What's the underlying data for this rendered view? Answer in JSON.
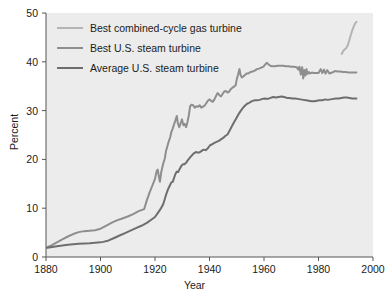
{
  "chart_data": {
    "type": "line",
    "title": "",
    "xlabel": "Year",
    "ylabel": "Percent",
    "xlim": [
      1880,
      2000
    ],
    "ylim": [
      0,
      50
    ],
    "xticks": [
      1880,
      1900,
      1920,
      1940,
      1960,
      1980,
      2000
    ],
    "yticks": [
      0,
      10,
      20,
      30,
      40,
      50
    ],
    "grid": false,
    "legend_position": "top-left",
    "series": [
      {
        "name": "Best combined-cycle gas turbine",
        "color": "#b4b4b4",
        "points": [
          [
            1988.5,
            41.6
          ],
          [
            1989.2,
            42.3
          ],
          [
            1989.8,
            42.6
          ],
          [
            1990.3,
            42.9
          ],
          [
            1990.8,
            43.5
          ],
          [
            1991.3,
            44.4
          ],
          [
            1991.8,
            45.4
          ],
          [
            1992.3,
            46.3
          ],
          [
            1992.9,
            47.2
          ],
          [
            1993.4,
            47.8
          ],
          [
            1993.9,
            48.2
          ]
        ]
      },
      {
        "name": "Best U.S. steam turbine",
        "color": "#8e8e8e",
        "points": [
          [
            1880.5,
            2.0
          ],
          [
            1882,
            2.4
          ],
          [
            1884,
            3.0
          ],
          [
            1886,
            3.6
          ],
          [
            1888,
            4.2
          ],
          [
            1890,
            4.7
          ],
          [
            1892,
            5.1
          ],
          [
            1894,
            5.3
          ],
          [
            1896,
            5.4
          ],
          [
            1898,
            5.5
          ],
          [
            1900,
            5.8
          ],
          [
            1902,
            6.4
          ],
          [
            1904,
            7.0
          ],
          [
            1906,
            7.5
          ],
          [
            1908,
            7.9
          ],
          [
            1910,
            8.3
          ],
          [
            1912,
            8.8
          ],
          [
            1914,
            9.4
          ],
          [
            1916,
            9.8
          ],
          [
            1917,
            11.6
          ],
          [
            1918,
            13.2
          ],
          [
            1919,
            14.6
          ],
          [
            1920,
            16.0
          ],
          [
            1920.6,
            17.6
          ],
          [
            1921,
            17.9
          ],
          [
            1921.4,
            16.6
          ],
          [
            1921.8,
            15.4
          ],
          [
            1922.3,
            17.4
          ],
          [
            1923,
            19.1
          ],
          [
            1923.6,
            20.2
          ],
          [
            1924,
            21.6
          ],
          [
            1924.6,
            22.8
          ],
          [
            1925,
            23.6
          ],
          [
            1925.6,
            24.6
          ],
          [
            1926,
            25.6
          ],
          [
            1926.5,
            26.3
          ],
          [
            1927,
            27.2
          ],
          [
            1927.5,
            28.0
          ],
          [
            1928,
            28.9
          ],
          [
            1928.4,
            27.4
          ],
          [
            1928.9,
            26.6
          ],
          [
            1929.4,
            27.4
          ],
          [
            1929.9,
            28.2
          ],
          [
            1930.4,
            27.0
          ],
          [
            1930.9,
            27.3
          ],
          [
            1931.4,
            26.6
          ],
          [
            1931.9,
            27.6
          ],
          [
            1932.4,
            29.0
          ],
          [
            1932.9,
            30.9
          ],
          [
            1933.4,
            31.2
          ],
          [
            1934,
            31.1
          ],
          [
            1934.6,
            30.6
          ],
          [
            1935.2,
            30.9
          ],
          [
            1935.8,
            30.8
          ],
          [
            1936.4,
            31.1
          ],
          [
            1937,
            30.6
          ],
          [
            1937.6,
            30.8
          ],
          [
            1938.2,
            31.0
          ],
          [
            1938.8,
            31.5
          ],
          [
            1939.4,
            32.0
          ],
          [
            1940,
            32.3
          ],
          [
            1940.6,
            32.0
          ],
          [
            1941.2,
            31.8
          ],
          [
            1941.8,
            32.3
          ],
          [
            1942.4,
            33.0
          ],
          [
            1943,
            33.6
          ],
          [
            1943.6,
            33.2
          ],
          [
            1944.2,
            32.9
          ],
          [
            1944.8,
            33.4
          ],
          [
            1945.4,
            33.9
          ],
          [
            1946,
            34.0
          ],
          [
            1946.6,
            33.7
          ],
          [
            1947.2,
            33.9
          ],
          [
            1947.8,
            34.4
          ],
          [
            1948.4,
            34.7
          ],
          [
            1949,
            34.9
          ],
          [
            1949.6,
            35.2
          ],
          [
            1950,
            36.4
          ],
          [
            1950.5,
            37.4
          ],
          [
            1951,
            38.5
          ],
          [
            1951.4,
            37.3
          ],
          [
            1951.9,
            36.8
          ],
          [
            1952.4,
            37.0
          ],
          [
            1953,
            37.3
          ],
          [
            1953.6,
            37.6
          ],
          [
            1954.2,
            37.6
          ],
          [
            1955,
            37.9
          ],
          [
            1955.8,
            38.0
          ],
          [
            1956.6,
            38.2
          ],
          [
            1957.4,
            38.5
          ],
          [
            1958.2,
            38.6
          ],
          [
            1959,
            38.8
          ],
          [
            1959.8,
            39.0
          ],
          [
            1960.4,
            39.4
          ],
          [
            1961,
            39.8
          ],
          [
            1961.6,
            39.5
          ],
          [
            1962.3,
            39.2
          ],
          [
            1963,
            39.1
          ],
          [
            1964,
            39.1
          ],
          [
            1965,
            39.2
          ],
          [
            1966,
            39.2
          ],
          [
            1967,
            39.2
          ],
          [
            1968,
            39.1
          ],
          [
            1969,
            39.1
          ],
          [
            1970,
            39.0
          ],
          [
            1971,
            39.0
          ],
          [
            1972,
            38.9
          ],
          [
            1972.6,
            38.4
          ],
          [
            1973,
            39.0
          ],
          [
            1973.5,
            37.4
          ],
          [
            1974,
            38.9
          ],
          [
            1974.4,
            36.6
          ],
          [
            1974.8,
            38.3
          ],
          [
            1975.2,
            37.2
          ],
          [
            1975.6,
            38.5
          ],
          [
            1976,
            37.5
          ],
          [
            1976.5,
            37.9
          ],
          [
            1977,
            37.6
          ],
          [
            1977.6,
            37.8
          ],
          [
            1978.2,
            37.7
          ],
          [
            1979,
            37.7
          ],
          [
            1980,
            37.7
          ],
          [
            1980.8,
            38.5
          ],
          [
            1981.4,
            37.7
          ],
          [
            1982,
            38.4
          ],
          [
            1982.6,
            37.6
          ],
          [
            1983.2,
            38.3
          ],
          [
            1984,
            37.6
          ],
          [
            1985,
            37.8
          ],
          [
            1986,
            38.1
          ],
          [
            1987,
            38.0
          ],
          [
            1988,
            38.0
          ],
          [
            1989,
            37.9
          ],
          [
            1990,
            37.9
          ],
          [
            1991,
            37.8
          ],
          [
            1992,
            37.8
          ],
          [
            1993,
            37.8
          ],
          [
            1993.9,
            37.8
          ]
        ]
      },
      {
        "name": "Average U.S. steam turbine",
        "color": "#6e6e6e",
        "points": [
          [
            1880.5,
            1.9
          ],
          [
            1884,
            2.2
          ],
          [
            1888,
            2.5
          ],
          [
            1892,
            2.7
          ],
          [
            1896,
            2.8
          ],
          [
            1900,
            3.0
          ],
          [
            1901,
            3.1
          ],
          [
            1903,
            3.4
          ],
          [
            1905,
            3.9
          ],
          [
            1907,
            4.4
          ],
          [
            1909,
            4.9
          ],
          [
            1911,
            5.4
          ],
          [
            1913,
            5.9
          ],
          [
            1915,
            6.4
          ],
          [
            1917,
            7.0
          ],
          [
            1919,
            7.8
          ],
          [
            1920,
            8.2
          ],
          [
            1921,
            9.0
          ],
          [
            1922,
            9.8
          ],
          [
            1923,
            10.8
          ],
          [
            1923.6,
            11.9
          ],
          [
            1924.2,
            13.0
          ],
          [
            1924.8,
            13.9
          ],
          [
            1925.4,
            14.6
          ],
          [
            1926,
            15.3
          ],
          [
            1926.5,
            15.4
          ],
          [
            1927,
            16.2
          ],
          [
            1927.5,
            17.0
          ],
          [
            1928,
            17.5
          ],
          [
            1928.5,
            17.4
          ],
          [
            1929,
            18.0
          ],
          [
            1929.6,
            18.6
          ],
          [
            1930.2,
            19.0
          ],
          [
            1930.8,
            19.0
          ],
          [
            1931.4,
            19.3
          ],
          [
            1932,
            19.8
          ],
          [
            1932.6,
            20.2
          ],
          [
            1933.2,
            20.6
          ],
          [
            1933.8,
            21.0
          ],
          [
            1934.4,
            21.3
          ],
          [
            1935,
            21.5
          ],
          [
            1935.6,
            21.4
          ],
          [
            1936.2,
            21.4
          ],
          [
            1937,
            21.7
          ],
          [
            1937.8,
            22.0
          ],
          [
            1938.6,
            21.9
          ],
          [
            1939.4,
            22.3
          ],
          [
            1940.2,
            22.9
          ],
          [
            1941,
            23.1
          ],
          [
            1941.8,
            23.4
          ],
          [
            1942.6,
            23.6
          ],
          [
            1943.4,
            23.8
          ],
          [
            1944.2,
            24.1
          ],
          [
            1945,
            24.4
          ],
          [
            1945.8,
            24.8
          ],
          [
            1946.6,
            25.1
          ],
          [
            1947.4,
            25.9
          ],
          [
            1948.2,
            26.8
          ],
          [
            1949,
            27.6
          ],
          [
            1949.8,
            28.4
          ],
          [
            1950.6,
            29.2
          ],
          [
            1951.4,
            29.9
          ],
          [
            1952.2,
            30.5
          ],
          [
            1953,
            31.0
          ],
          [
            1953.8,
            31.4
          ],
          [
            1954.6,
            31.6
          ],
          [
            1955.4,
            31.9
          ],
          [
            1956.4,
            32.1
          ],
          [
            1957.4,
            32.1
          ],
          [
            1958.4,
            32.2
          ],
          [
            1959.4,
            32.4
          ],
          [
            1960.4,
            32.5
          ],
          [
            1961.4,
            32.4
          ],
          [
            1962.4,
            32.6
          ],
          [
            1963.4,
            32.8
          ],
          [
            1964.4,
            32.7
          ],
          [
            1965.4,
            32.8
          ],
          [
            1966.4,
            32.9
          ],
          [
            1967.4,
            32.8
          ],
          [
            1968.4,
            32.6
          ],
          [
            1969.4,
            32.6
          ],
          [
            1970.4,
            32.5
          ],
          [
            1971.4,
            32.5
          ],
          [
            1972.4,
            32.4
          ],
          [
            1973.4,
            32.3
          ],
          [
            1974.4,
            32.2
          ],
          [
            1975.4,
            32.1
          ],
          [
            1976.4,
            32.0
          ],
          [
            1977.4,
            31.9
          ],
          [
            1978.4,
            31.9
          ],
          [
            1979.4,
            32.0
          ],
          [
            1980.4,
            32.1
          ],
          [
            1981.4,
            32.1
          ],
          [
            1982.4,
            32.3
          ],
          [
            1983.4,
            32.2
          ],
          [
            1984.4,
            32.3
          ],
          [
            1985.4,
            32.4
          ],
          [
            1986.4,
            32.5
          ],
          [
            1987.4,
            32.5
          ],
          [
            1988.4,
            32.6
          ],
          [
            1989.4,
            32.7
          ],
          [
            1990.4,
            32.7
          ],
          [
            1991.4,
            32.6
          ],
          [
            1992.4,
            32.5
          ],
          [
            1993.4,
            32.5
          ],
          [
            1993.9,
            32.5
          ]
        ]
      }
    ]
  },
  "axes": {
    "y_title": "Percent",
    "x_title": "Year",
    "y_tick_labels": [
      "50",
      "40",
      "30",
      "20",
      "10",
      "0"
    ],
    "x_tick_labels": [
      "1880",
      "1900",
      "1920",
      "1940",
      "1960",
      "1980",
      "2000"
    ]
  },
  "legend": {
    "items": [
      {
        "label": "Best combined-cycle gas turbine",
        "color": "#b4b4b4"
      },
      {
        "label": "Best U.S. steam turbine",
        "color": "#8e8e8e"
      },
      {
        "label": "Average U.S. steam turbine",
        "color": "#6e6e6e"
      }
    ]
  },
  "style": {
    "plot_background": "#ececec",
    "page_background": "#ffffff",
    "axis_color": "#555555",
    "text_color": "#1b1b1b"
  }
}
